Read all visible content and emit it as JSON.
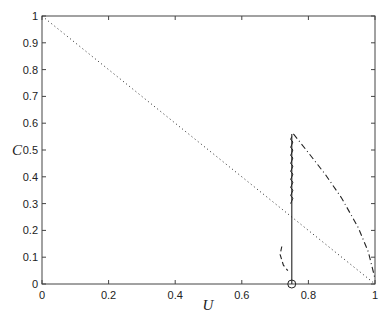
{
  "chart_data": {
    "type": "line",
    "title": "",
    "xlabel": "U",
    "ylabel": "C",
    "xlim": [
      0,
      1
    ],
    "ylim": [
      0,
      1
    ],
    "grid": false,
    "legend": null,
    "xticks": [
      "0",
      "0.2",
      "0.4",
      "0.6",
      "0.8",
      "1"
    ],
    "yticks": [
      "0",
      "0.1",
      "0.2",
      "0.3",
      "0.4",
      "0.5",
      "0.6",
      "0.7",
      "0.8",
      "0.9",
      "1"
    ],
    "series": [
      {
        "name": "diagonal",
        "style": "dotted",
        "x": [
          0,
          1
        ],
        "y": [
          1,
          0
        ]
      },
      {
        "name": "vertical-solid",
        "style": "solid",
        "x": [
          0.75,
          0.75
        ],
        "y": [
          0,
          0.56
        ]
      },
      {
        "name": "dash-dot-curve",
        "style": "dash-dot",
        "x": [
          0.755,
          0.8,
          0.85,
          0.9,
          0.95,
          0.98,
          1.0
        ],
        "y": [
          0.56,
          0.49,
          0.41,
          0.32,
          0.21,
          0.12,
          0.02
        ]
      },
      {
        "name": "short-dashed-curve",
        "style": "dashed",
        "x": [
          0.72,
          0.715,
          0.725,
          0.738
        ],
        "y": [
          0.14,
          0.11,
          0.07,
          0.05
        ]
      }
    ],
    "markers": [
      {
        "name": "circle-marker",
        "x": 0.75,
        "y": 0
      }
    ]
  }
}
